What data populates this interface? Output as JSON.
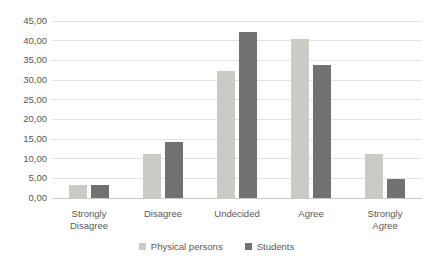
{
  "chart_data": {
    "type": "bar",
    "title": "",
    "xlabel": "",
    "ylabel": "",
    "categories": [
      "Strongly Disagree",
      "Disagree",
      "Undecided",
      "Agree",
      "Strongly Agree"
    ],
    "series": [
      {
        "name": "Physical persons",
        "color": "#c9ccc4",
        "values": [
          3.2,
          11.1,
          32.3,
          40.5,
          11.1
        ]
      },
      {
        "name": "Students",
        "color": "#717171",
        "values": [
          3.3,
          14.2,
          42.3,
          33.9,
          4.8
        ]
      }
    ],
    "ylim": [
      0,
      45
    ],
    "ytick_step": 5,
    "ytick_labels": [
      "0,00",
      "5,00",
      "10,00",
      "15,00",
      "20,00",
      "25,00",
      "30,00",
      "35,00",
      "40,00",
      "45,00"
    ],
    "grid": true,
    "legend_position": "bottom"
  },
  "colors": {
    "background": "#ffffff",
    "gridline": "#e2e2e2",
    "axis_line": "#c9c9c9",
    "text": "#595959"
  }
}
